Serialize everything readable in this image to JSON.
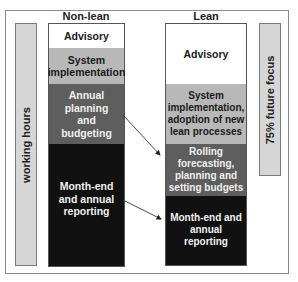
{
  "side_labels": {
    "left": "working hours",
    "right": "75% future focus"
  },
  "columns": [
    {
      "title": "Non-lean",
      "segments": [
        {
          "label": "Advisory",
          "fill": "#ffffff",
          "text_color": "#1a1a1a"
        },
        {
          "label": "System implementation",
          "fill": "#b8b8b8",
          "text_color": "#1a1a1a"
        },
        {
          "label": "Annual planning and budgeting",
          "fill": "#5e5e5e",
          "text_color": "#f0f0f0"
        },
        {
          "label": "Month-end and annual reporting",
          "fill": "#111111",
          "text_color": "#f0f0f0"
        }
      ]
    },
    {
      "title": "Lean",
      "segments": [
        {
          "label": "Advisory",
          "fill": "#ffffff",
          "text_color": "#1a1a1a"
        },
        {
          "label": "System implementation, adoption of new lean processes",
          "fill": "#b8b8b8",
          "text_color": "#1a1a1a"
        },
        {
          "label": "Rolling forecasting, planning and setting budgets",
          "fill": "#5e5e5e",
          "text_color": "#f0f0f0"
        },
        {
          "label": "Month-end and annual reporting",
          "fill": "#111111",
          "text_color": "#f0f0f0"
        }
      ]
    }
  ],
  "arrows": [
    {
      "from": "Annual planning and budgeting",
      "to": "Rolling forecasting, planning and setting budgets"
    },
    {
      "from": "Month-end and annual reporting",
      "to": "Month-end and annual reporting"
    }
  ]
}
